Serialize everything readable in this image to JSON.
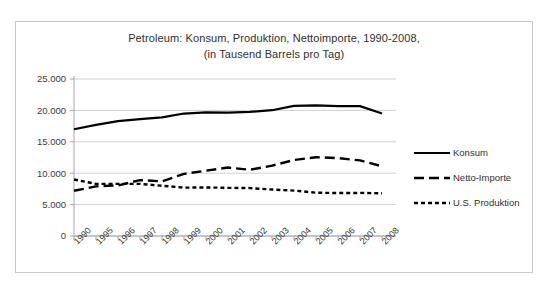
{
  "chart": {
    "title_line1": "Petroleum: Konsum, Produktion, Nettoimporte, 1990-2008,",
    "title_line2": "(in Tausend Barrels pro Tag)"
  },
  "chart_data": {
    "type": "line",
    "title": "Petroleum: Konsum, Produktion, Nettoimporte, 1990-2008, (in Tausend Barrels pro Tag)",
    "xlabel": "",
    "ylabel": "",
    "ylim": [
      0,
      25000
    ],
    "yticks": [
      0,
      5000,
      10000,
      15000,
      20000,
      25000
    ],
    "ytick_labels": [
      "0",
      "5.000",
      "10.000",
      "15.000",
      "20.000",
      "25.000"
    ],
    "grid": true,
    "legend_position": "right",
    "categories": [
      "1990",
      "1995",
      "1996",
      "1997",
      "1998",
      "1999",
      "2000",
      "2001",
      "2002",
      "2003",
      "2004",
      "2005",
      "2006",
      "2007",
      "2008"
    ],
    "series": [
      {
        "name": "Konsum",
        "style": "solid",
        "color": "#000000",
        "values": [
          17000,
          17700,
          18300,
          18600,
          18900,
          19500,
          19700,
          19650,
          19760,
          20030,
          20730,
          20800,
          20690,
          20680,
          19500
        ]
      },
      {
        "name": "Netto-Importe",
        "style": "dashed",
        "color": "#000000",
        "values": [
          7200,
          7900,
          8050,
          8900,
          8700,
          9900,
          10400,
          10900,
          10550,
          11200,
          12100,
          12550,
          12400,
          12040,
          11100
        ]
      },
      {
        "name": "U.S. Produktion",
        "style": "dotted",
        "color": "#000000",
        "values": [
          9000,
          8300,
          8300,
          8300,
          8000,
          7700,
          7730,
          7670,
          7630,
          7400,
          7230,
          6900,
          6840,
          6860,
          6800
        ]
      }
    ]
  },
  "legend": {
    "items": [
      {
        "label": "Konsum",
        "style": "solid"
      },
      {
        "label": "Netto-Importe",
        "style": "dashed"
      },
      {
        "label": "U.S. Produktion",
        "style": "dotted"
      }
    ]
  }
}
